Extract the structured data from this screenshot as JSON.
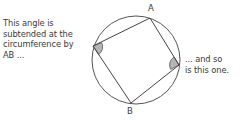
{
  "annotations": {
    "left": "This angle is\nsubtended at the\ncircumference by\nAB ...",
    "right": "... and so\nis this one."
  },
  "labels": {
    "a": "A",
    "b": "B"
  },
  "geometry": {
    "circle": {
      "cx": 136,
      "cy": 60,
      "r": 44
    },
    "vertices": {
      "A": [
        150,
        18
      ],
      "right": [
        179,
        65
      ],
      "B": [
        131,
        103
      ],
      "left": [
        93,
        46
      ]
    }
  },
  "colors": {
    "stroke": "#3a3a3a",
    "angle_fill": "#b5b5b5",
    "text": "#3a3a3a"
  }
}
